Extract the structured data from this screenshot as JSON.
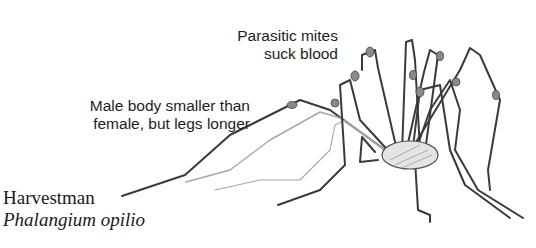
{
  "illustration": {
    "subject": "harvestman",
    "ink_color": "#3a3a3a",
    "light_leg_color": "#a8a8a8"
  },
  "annotations": {
    "mites_line1": "Parasitic mites",
    "mites_line2": "suck blood",
    "male_line1": "Male body smaller than",
    "male_line2": "female, but legs longer"
  },
  "caption": {
    "common_name": "Harvestman",
    "scientific_name": "Phalangium opilio"
  }
}
